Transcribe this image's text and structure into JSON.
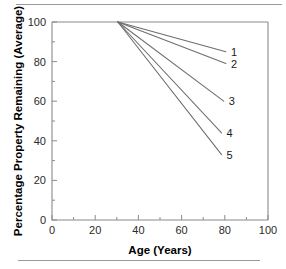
{
  "figure": {
    "background_color": "#ffffff",
    "line_color": "#6d6d6d",
    "axis_color": "#8a8a8a",
    "text_color": "#1a1a1a",
    "rule_top_label": "horizontal-rule",
    "rule_bottom_label": "horizontal-rule"
  },
  "chart_data": {
    "type": "line",
    "title": "",
    "xlabel": "Age (Years)",
    "ylabel": "Percentage Property Remaining (Average)",
    "xlim": [
      0,
      100
    ],
    "ylim": [
      0,
      100
    ],
    "xticks": [
      0,
      20,
      40,
      60,
      80,
      100
    ],
    "yticks": [
      0,
      20,
      40,
      60,
      80,
      100
    ],
    "xtick_labels": [
      "0",
      "20",
      "40",
      "60",
      "80",
      "100"
    ],
    "ytick_labels": [
      "0",
      "20",
      "40",
      "60",
      "80",
      "100"
    ],
    "xminor_step": 10,
    "yminor_step": 10,
    "grid": false,
    "legend": "inline-end-labels",
    "series": [
      {
        "name": "1",
        "label": "1",
        "x": [
          30.5,
          80.5
        ],
        "y": [
          100,
          85
        ]
      },
      {
        "name": "2",
        "label": "2",
        "x": [
          30.5,
          80.5
        ],
        "y": [
          100,
          79
        ]
      },
      {
        "name": "3",
        "label": "3",
        "x": [
          30.5,
          79.5
        ],
        "y": [
          100,
          60
        ]
      },
      {
        "name": "4",
        "label": "4",
        "x": [
          30.5,
          78.5
        ],
        "y": [
          100,
          44
        ]
      },
      {
        "name": "5",
        "label": "5",
        "x": [
          30.5,
          78.5
        ],
        "y": [
          100,
          33
        ]
      }
    ]
  }
}
